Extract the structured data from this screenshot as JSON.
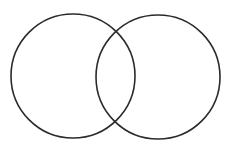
{
  "diagram": {
    "type": "venn",
    "background": "#ffffff",
    "stroke_color": "#2b2b2b",
    "stroke_width": 1.6,
    "sets": [
      {
        "id": "left",
        "label": "",
        "cx": 73,
        "cy": 76,
        "r": 62
      },
      {
        "id": "right",
        "label": "",
        "cx": 158,
        "cy": 77,
        "r": 62
      }
    ]
  }
}
